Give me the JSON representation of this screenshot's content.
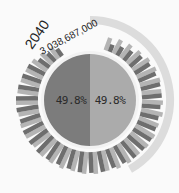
{
  "chart_data": {
    "type": "radial-bar",
    "title": "",
    "annotation": {
      "year": "2040",
      "value": "3,038,687,000"
    },
    "center": {
      "left": {
        "label": "49.8%",
        "value": 49.8,
        "color": "#7c7c7c"
      },
      "right": {
        "label": "49.8%",
        "value": 49.8,
        "color": "#ababab"
      }
    },
    "radial_bars": {
      "count": 34,
      "series": [
        {
          "name": "dark",
          "color": "#6e6e6e"
        },
        {
          "name": "light",
          "color": "#b4b4b4"
        }
      ],
      "dark_lengths": [
        0.35,
        0.45,
        0.55,
        0.7,
        0.8,
        0.85,
        0.9,
        0.9,
        0.85,
        0.85,
        0.9,
        0.95,
        0.95,
        0.95,
        0.9,
        0.9,
        0.95,
        0.95,
        0.95,
        0.9,
        0.9,
        0.95,
        1.0,
        1.0,
        1.0,
        0.95,
        1.0,
        1.0,
        0.95,
        0.9,
        0.85,
        0.6,
        0.5,
        0.4
      ],
      "light_lengths": [
        0.6,
        0.7,
        0.75,
        0.8,
        0.9,
        0.95,
        0.95,
        0.9,
        0.95,
        1.0,
        0.95,
        1.0,
        1.0,
        0.95,
        1.0,
        1.0,
        0.95,
        1.0,
        1.0,
        0.95,
        1.0,
        1.0,
        1.0,
        0.95,
        1.0,
        1.0,
        0.95,
        1.0,
        0.95,
        0.9,
        0.85,
        0.8,
        0.7,
        0.6
      ]
    },
    "outer_arc": {
      "start_deg": -90,
      "end_deg": 60,
      "color": "#dcdcdc"
    }
  }
}
